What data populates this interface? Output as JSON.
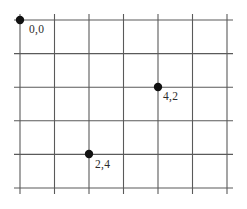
{
  "figure": {
    "kind": "coordinate-grid-diagram",
    "width": 247,
    "height": 209,
    "background_color": "#ffffff",
    "grid_line_color": "#5a5a5a",
    "grid_line_width": 1.1,
    "point_color": "#111111",
    "point_radius": 4.2,
    "label_color": "#2b2b2b",
    "label_font_size": 11.5
  },
  "chart_data": {
    "type": "scatter",
    "title": "",
    "xlabel": "",
    "ylabel": "",
    "grid": true,
    "legend": null,
    "grid_columns": 7,
    "grid_rows": 6,
    "x_gridlines": [
      20,
      54.5,
      89,
      123.5,
      158,
      192.5,
      227
    ],
    "y_gridlines": [
      20,
      53.6,
      87.2,
      120.8,
      154.4,
      188
    ],
    "line_overhang": 6,
    "points": [
      {
        "label": "0,0",
        "x_index": 0,
        "y_index": 0,
        "px": 20,
        "py": 20,
        "label_px": 29,
        "label_py": 24
      },
      {
        "label": "4,2",
        "x_index": 4,
        "y_index": 2,
        "px": 158,
        "py": 87,
        "label_px": 163,
        "label_py": 91
      },
      {
        "label": "2,4",
        "x_index": 2,
        "y_index": 4,
        "px": 89,
        "py": 154,
        "label_px": 95,
        "label_py": 159
      }
    ]
  }
}
